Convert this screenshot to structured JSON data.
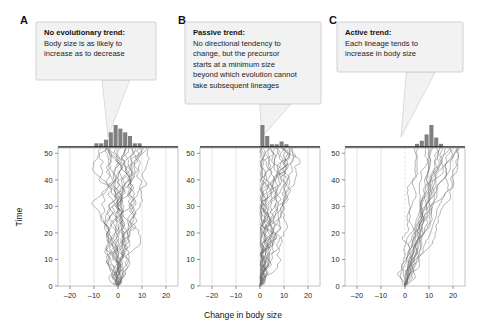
{
  "figure": {
    "shared_xlabel": "Change in body size",
    "shared_ylabel": "Time",
    "background": "#ffffff",
    "line_color": "#6f6f6f",
    "bar_color": "#808080",
    "box_fill": "#f2f2f2",
    "box_stroke": "#c8c8c8"
  },
  "panels": [
    {
      "letter": "A",
      "callout": {
        "title": "No evolutionary trend:",
        "lines": [
          "Body size is as likely to",
          "increase as to decrease"
        ]
      },
      "chart_data": {
        "type": "line",
        "title": "No evolutionary trend",
        "xlabel": "Change in body size",
        "ylabel": "Time",
        "xlim": [
          -25,
          25
        ],
        "ylim": [
          0,
          52
        ],
        "xticks": [
          -20,
          -10,
          0,
          10,
          20
        ],
        "xticklabels": [
          "–20",
          "–10",
          "0",
          "10",
          "20"
        ],
        "yticks": [
          0,
          10,
          20,
          30,
          40,
          50
        ],
        "yticklabels": [
          "0",
          "10",
          "20",
          "30",
          "40",
          "50"
        ],
        "grid": "vertical",
        "zero_line": false,
        "start_x": 0,
        "drift": 0.0,
        "volatility": 1.05,
        "bounded_left": false,
        "n_lineages": 22,
        "seed": 17,
        "histogram": {
          "bin_edges": [
            -10,
            -8,
            -6,
            -4,
            -2,
            0,
            2,
            4,
            6,
            8,
            10
          ],
          "counts": [
            1,
            1,
            2,
            4,
            6,
            5,
            4,
            3,
            1,
            1
          ],
          "max_count": 6,
          "description": "symmetric unimodal distribution centered near 0"
        }
      }
    },
    {
      "letter": "B",
      "callout": {
        "title": "Passive trend:",
        "lines": [
          "No directional tendency to",
          "change, but the precursor",
          "starts at a minimum size",
          "beyond which evolution cannot",
          "take subsequent lineages"
        ]
      },
      "chart_data": {
        "type": "line",
        "title": "Passive trend",
        "xlabel": "Change in body size",
        "ylabel": "Time",
        "xlim": [
          -25,
          25
        ],
        "ylim": [
          0,
          52
        ],
        "xticks": [
          -20,
          -10,
          0,
          10,
          20
        ],
        "xticklabels": [
          "–20",
          "–10",
          "0",
          "10",
          "20"
        ],
        "yticks": [
          0,
          10,
          20,
          30,
          40,
          50
        ],
        "yticklabels": [
          "0",
          "10",
          "20",
          "30",
          "40",
          "50"
        ],
        "grid": "vertical",
        "zero_line": false,
        "start_x": 0,
        "drift": 0.08,
        "volatility": 1.0,
        "bounded_left": true,
        "left_bound": 0,
        "n_lineages": 20,
        "seed": 41,
        "histogram": {
          "bin_edges": [
            0,
            2,
            4,
            6,
            8,
            10,
            12,
            14,
            16
          ],
          "counts": [
            8,
            4,
            1,
            1,
            2,
            1,
            0,
            0
          ],
          "max_count": 8,
          "description": "right-skewed distribution piled against the minimum at 0"
        }
      }
    },
    {
      "letter": "C",
      "callout": {
        "title": "Active trend:",
        "lines": [
          "Each lineage tends to",
          "increase in body size"
        ]
      },
      "chart_data": {
        "type": "line",
        "title": "Active trend",
        "xlabel": "Change in body size",
        "ylabel": "Time",
        "xlim": [
          -25,
          25
        ],
        "ylim": [
          0,
          52
        ],
        "xticks": [
          -20,
          -10,
          0,
          10,
          20
        ],
        "xticklabels": [
          "–20",
          "–10",
          "0",
          "10",
          "20"
        ],
        "yticks": [
          0,
          10,
          20,
          30,
          40,
          50
        ],
        "yticklabels": [
          "0",
          "10",
          "20",
          "30",
          "40",
          "50"
        ],
        "grid": "vertical",
        "zero_line": true,
        "zero_line_style": "dashed",
        "start_x": 0,
        "drift": 0.23,
        "volatility": 0.62,
        "bounded_left": false,
        "n_lineages": 18,
        "seed": 7,
        "histogram": {
          "bin_edges": [
            2,
            4,
            6,
            8,
            10,
            12,
            14,
            16,
            18
          ],
          "counts": [
            0,
            1,
            2,
            4,
            7,
            3,
            1,
            0
          ],
          "max_count": 7,
          "description": "distribution shifted well to the right of zero, centered near 10"
        }
      }
    }
  ]
}
